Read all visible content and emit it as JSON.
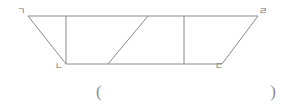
{
  "figure": {
    "name": "trapezoid-divided-figure",
    "shape_type": "trapezoid",
    "stroke_color": "#8a8a8a",
    "stroke_width": 1,
    "background_color": "#ffffff",
    "vertices": [
      {
        "id": "top-left",
        "label": "ㄱ",
        "x": 28,
        "y": 16
      },
      {
        "id": "top-right",
        "label": "ㄹ",
        "x": 258,
        "y": 16
      },
      {
        "id": "bottom-right",
        "label": "ㄷ",
        "x": 222,
        "y": 64
      },
      {
        "id": "bottom-left",
        "label": "ㄴ",
        "x": 66,
        "y": 64
      }
    ],
    "outline_points": "28,16 258,16 222,64 66,64",
    "interior_lines": [
      {
        "id": "vertical-left",
        "x1": 66,
        "y1": 16,
        "x2": 66,
        "y2": 64
      },
      {
        "id": "diagonal",
        "x1": 108,
        "y1": 64,
        "x2": 148,
        "y2": 16
      },
      {
        "id": "vertical-right",
        "x1": 184,
        "y1": 16,
        "x2": 184,
        "y2": 64
      }
    ]
  },
  "answer": {
    "open_paren": "(",
    "close_paren": ")",
    "value": ""
  }
}
